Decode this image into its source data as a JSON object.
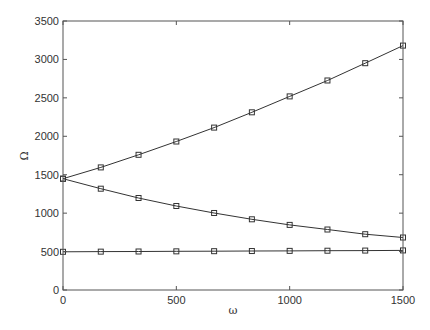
{
  "chart_data": {
    "type": "line",
    "title": "",
    "xlabel": "ω",
    "ylabel": "Ω",
    "xlim": [
      0,
      1500
    ],
    "ylim": [
      0,
      3500
    ],
    "xticks": [
      0,
      500,
      1000,
      1500
    ],
    "yticks": [
      0,
      500,
      1000,
      1500,
      2000,
      2500,
      3000,
      3500
    ],
    "xtick_labels": [
      "0",
      "500",
      "1000",
      "1500"
    ],
    "ytick_labels": [
      "0",
      "500",
      "1000",
      "1500",
      "2000",
      "2500",
      "3000",
      "3500"
    ],
    "grid": false,
    "legend": null,
    "marker": "hollow-square",
    "line_color": "#333333",
    "x": [
      0,
      166.7,
      333.3,
      500,
      666.7,
      833.3,
      1000,
      1166.7,
      1333.3,
      1500
    ],
    "series": [
      {
        "name": "upper branch",
        "values": [
          1448,
          1595,
          1759,
          1932,
          2113,
          2312,
          2519,
          2726,
          2951,
          3180
        ]
      },
      {
        "name": "lower branch",
        "values": [
          1448,
          1318,
          1197,
          1093,
          1002,
          920,
          847,
          787,
          726,
          683
        ]
      },
      {
        "name": "flat branch",
        "values": [
          497,
          499,
          501,
          503,
          505,
          507,
          509,
          511,
          513,
          515
        ]
      }
    ]
  },
  "layout": {
    "plot_left": 63,
    "plot_right": 403,
    "plot_top": 21,
    "plot_bottom": 290
  }
}
